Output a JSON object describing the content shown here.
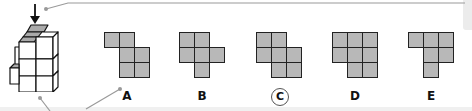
{
  "puzzle": {
    "arrow_icon": "down-arrow",
    "cube_figure": "3d-stack-of-cubes",
    "options": [
      {
        "label": "A",
        "selected": false,
        "cells": [
          [
            0,
            0
          ],
          [
            0,
            1
          ],
          [
            1,
            1
          ],
          [
            1,
            2
          ],
          [
            2,
            1
          ],
          [
            2,
            2
          ]
        ],
        "x": 104
      },
      {
        "label": "B",
        "selected": false,
        "cells": [
          [
            0,
            0
          ],
          [
            0,
            1
          ],
          [
            1,
            0
          ],
          [
            1,
            1
          ],
          [
            1,
            2
          ],
          [
            2,
            1
          ]
        ],
        "x": 179
      },
      {
        "label": "C",
        "selected": true,
        "cells": [
          [
            0,
            0
          ],
          [
            0,
            1
          ],
          [
            1,
            0
          ],
          [
            1,
            1
          ],
          [
            1,
            2
          ],
          [
            2,
            1
          ],
          [
            2,
            2
          ]
        ],
        "x": 256
      },
      {
        "label": "D",
        "selected": false,
        "cells": [
          [
            0,
            0
          ],
          [
            0,
            1
          ],
          [
            0,
            2
          ],
          [
            1,
            0
          ],
          [
            1,
            1
          ],
          [
            1,
            2
          ],
          [
            2,
            1
          ],
          [
            2,
            2
          ]
        ],
        "x": 332
      },
      {
        "label": "E",
        "selected": false,
        "cells": [
          [
            0,
            0
          ],
          [
            0,
            1
          ],
          [
            0,
            2
          ],
          [
            1,
            1
          ],
          [
            1,
            2
          ],
          [
            2,
            1
          ]
        ],
        "x": 408
      }
    ]
  },
  "colors": {
    "cell_fill": "#b8b8b8",
    "cell_border": "#222222",
    "connector": "#999999"
  }
}
